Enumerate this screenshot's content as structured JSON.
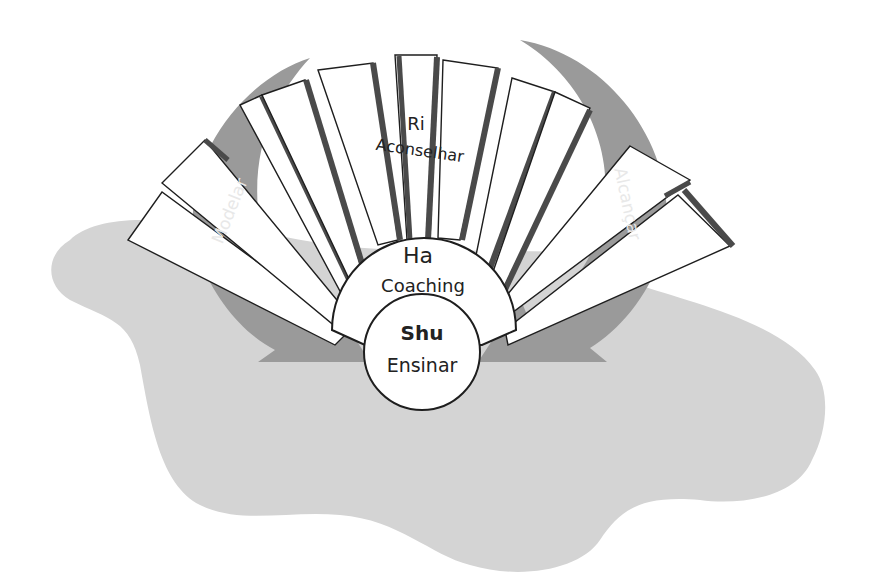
{
  "diagram": {
    "type": "shu-ha-ri",
    "colors": {
      "background": "#ffffff",
      "blob": "#d4d4d4",
      "arrow": "#9a9a9a",
      "panel_fill": "#ffffff",
      "panel_shadow": "#4a4a4a",
      "stroke": "#1e1e1e"
    },
    "stages": {
      "shu": {
        "title": "Shu",
        "subtitle": "Ensinar"
      },
      "ha": {
        "title": "Ha",
        "subtitle": "Coaching"
      },
      "ri": {
        "title": "Ri",
        "subtitle": "Aconselhar"
      }
    },
    "arrows": {
      "left": {
        "label": "Modelar"
      },
      "right": {
        "label": "Alcançar"
      }
    }
  }
}
